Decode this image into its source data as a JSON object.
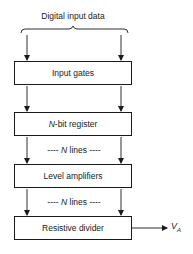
{
  "diagram": {
    "input_label": "Digital input data",
    "blocks": [
      {
        "id": "input-gates",
        "label": "Input gates"
      },
      {
        "id": "register",
        "label_prefix": "N",
        "label_suffix": "-bit register"
      },
      {
        "id": "level-amplifiers",
        "label": "Level amplifiers"
      },
      {
        "id": "resistive-divider",
        "label": "Resistive divider"
      }
    ],
    "bus_labels": [
      {
        "dashes_left": "----",
        "italic": "N",
        "text": "lines",
        "dashes_right": "----"
      },
      {
        "dashes_left": "----",
        "italic": "N",
        "text": "lines",
        "dashes_right": "----"
      }
    ],
    "output": {
      "symbol": "V",
      "subscript": "A"
    }
  }
}
